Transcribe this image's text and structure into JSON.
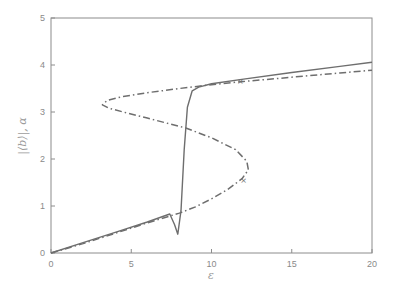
{
  "chart_data": {
    "type": "line",
    "title": "",
    "xlabel": "ε",
    "ylabel": "|⟨b⟩|, α",
    "xlim": [
      0,
      20
    ],
    "ylim": [
      0,
      5
    ],
    "xticks": [
      0,
      5,
      10,
      15,
      20
    ],
    "yticks": [
      0,
      1,
      2,
      3,
      4,
      5
    ],
    "grid": false,
    "legend": null,
    "series": [
      {
        "name": "|⟨b⟩| (solid)",
        "style": "solid",
        "points": [
          [
            0,
            0
          ],
          [
            2,
            0.22
          ],
          [
            4,
            0.44
          ],
          [
            6,
            0.66
          ],
          [
            7.4,
            0.83
          ],
          [
            7.7,
            0.6
          ],
          [
            7.9,
            0.4
          ],
          [
            8.1,
            0.9
          ],
          [
            8.3,
            2.2
          ],
          [
            8.5,
            3.1
          ],
          [
            8.8,
            3.45
          ],
          [
            9.2,
            3.53
          ],
          [
            10,
            3.6
          ],
          [
            12,
            3.7
          ],
          [
            15,
            3.84
          ],
          [
            18,
            3.97
          ],
          [
            20,
            4.06
          ]
        ]
      },
      {
        "name": "α (dash-dot)",
        "style": "dash-dot",
        "points": [
          [
            0,
            0
          ],
          [
            2,
            0.2
          ],
          [
            4,
            0.42
          ],
          [
            6,
            0.64
          ],
          [
            8,
            0.85
          ],
          [
            9,
            0.98
          ],
          [
            10,
            1.15
          ],
          [
            11,
            1.35
          ],
          [
            11.9,
            1.58
          ],
          [
            12.3,
            1.77
          ],
          [
            12.2,
            1.95
          ],
          [
            11.5,
            2.2
          ],
          [
            10,
            2.45
          ],
          [
            8.4,
            2.66
          ],
          [
            6,
            2.87
          ],
          [
            4.5,
            3.0
          ],
          [
            3.6,
            3.08
          ],
          [
            3.2,
            3.15
          ],
          [
            3.5,
            3.25
          ],
          [
            4.5,
            3.33
          ],
          [
            6,
            3.41
          ],
          [
            8,
            3.5
          ],
          [
            9.2,
            3.55
          ],
          [
            10,
            3.58
          ],
          [
            12,
            3.65
          ],
          [
            15,
            3.74
          ],
          [
            18,
            3.83
          ],
          [
            20,
            3.89
          ]
        ]
      }
    ],
    "markers": [
      {
        "symbol": "×",
        "x": 12.0,
        "y": 1.55
      },
      {
        "symbol": "×",
        "x": 11.8,
        "y": 3.66
      }
    ]
  }
}
